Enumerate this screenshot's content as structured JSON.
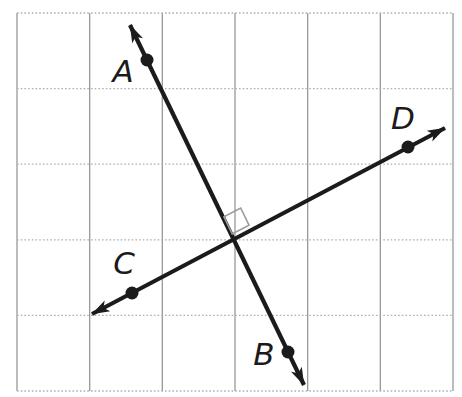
{
  "figure": {
    "width": 462,
    "height": 397,
    "background": "#ffffff"
  },
  "diagram": {
    "grid": {
      "vertical_color": "#8f8f8f",
      "horizontal_color": "#aeaeae",
      "vertical_width": 1.2,
      "horizontal_width": 1.3,
      "horizontal_dash": "1.6 2.1",
      "x_lines": [
        17,
        89.7,
        162.3,
        235,
        307.7,
        380.3,
        453
      ],
      "y_lines": [
        13,
        88.6,
        164.2,
        239.8,
        315.4,
        391
      ]
    },
    "line_color": "#1b1b1b",
    "line_width": 4.2,
    "lines": [
      {
        "name": "line-AB",
        "x1": 130,
        "y1": 25,
        "x2": 304,
        "y2": 385
      },
      {
        "name": "line-CD",
        "x1": 92,
        "y1": 314,
        "x2": 445,
        "y2": 128
      }
    ],
    "points": [
      {
        "label": "A",
        "x": 147,
        "y": 60,
        "label_x": 123,
        "label_y": 71
      },
      {
        "label": "B",
        "x": 288,
        "y": 352,
        "label_x": 264,
        "label_y": 354
      },
      {
        "label": "C",
        "x": 132,
        "y": 293,
        "label_x": 124,
        "label_y": 263
      },
      {
        "label": "D",
        "x": 408,
        "y": 147,
        "label_x": 403,
        "label_y": 118
      }
    ],
    "point_radius": 6.5,
    "point_color": "#1b1b1b",
    "label_color": "#1b1b1b",
    "label_font_size": 31,
    "right_angle": {
      "color": "#9a9a9a",
      "stroke_width": 1.6,
      "points": "232.2,234.0 223.9,216.9 240.7,208.0 249.0,225.1"
    }
  }
}
